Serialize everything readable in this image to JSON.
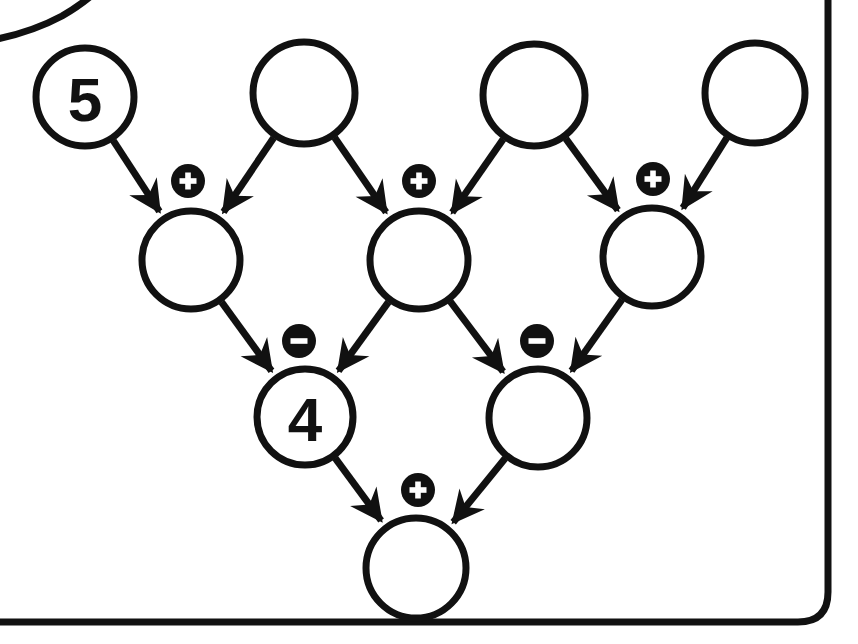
{
  "canvas": {
    "width": 858,
    "height": 644,
    "background": "#ffffff",
    "ink": "#111111",
    "badge_fill": "#111111",
    "badge_glyph_color": "#ffffff"
  },
  "frame": {
    "name": "rounded-card-border",
    "stroke": "#111111",
    "stroke_width": 7,
    "corner_radius": 30,
    "note": "outer rounded rectangle, cropped at left and top edges; second inner arc visible at top-left"
  },
  "diagram": {
    "type": "arithmetic-pyramid",
    "title": "",
    "rows": [
      {
        "row_index": 0,
        "name": "top-operand-row",
        "nodes": [
          {
            "id": "t1",
            "label": "5",
            "filled": false,
            "cx": 85,
            "cy": 97,
            "r": 49
          },
          {
            "id": "t2",
            "label": "",
            "filled": false,
            "cx": 304,
            "cy": 93,
            "r": 51
          },
          {
            "id": "t3",
            "label": "",
            "filled": false,
            "cx": 534,
            "cy": 95,
            "r": 51
          },
          {
            "id": "t4",
            "label": "",
            "filled": false,
            "cx": 755,
            "cy": 93,
            "r": 50
          }
        ]
      },
      {
        "row_index": 1,
        "name": "second-row",
        "nodes": [
          {
            "id": "m1",
            "label": "",
            "filled": false,
            "cx": 191,
            "cy": 260,
            "r": 49
          },
          {
            "id": "m2",
            "label": "",
            "filled": false,
            "cx": 419,
            "cy": 260,
            "r": 49
          },
          {
            "id": "m3",
            "label": "",
            "filled": false,
            "cx": 652,
            "cy": 257,
            "r": 49
          }
        ]
      },
      {
        "row_index": 2,
        "name": "third-row",
        "nodes": [
          {
            "id": "b1",
            "label": "4",
            "filled": false,
            "cx": 305,
            "cy": 417,
            "r": 48
          },
          {
            "id": "b2",
            "label": "",
            "filled": false,
            "cx": 538,
            "cy": 418,
            "r": 49
          }
        ]
      },
      {
        "row_index": 3,
        "name": "result-row",
        "nodes": [
          {
            "id": "r1",
            "label": "",
            "filled": false,
            "cx": 416,
            "cy": 568,
            "r": 50
          }
        ]
      }
    ],
    "operators": [
      {
        "id": "op1",
        "symbol": "+",
        "name": "plus",
        "cx": 188,
        "cy": 181,
        "r": 17,
        "inputs": [
          "t1",
          "t2"
        ],
        "output": "m1"
      },
      {
        "id": "op2",
        "symbol": "+",
        "name": "plus",
        "cx": 419,
        "cy": 181,
        "r": 17,
        "inputs": [
          "t2",
          "t3"
        ],
        "output": "m2"
      },
      {
        "id": "op3",
        "symbol": "+",
        "name": "plus",
        "cx": 653,
        "cy": 179,
        "r": 17,
        "inputs": [
          "t3",
          "t4"
        ],
        "output": "m3"
      },
      {
        "id": "op4",
        "symbol": "−",
        "name": "minus",
        "cx": 299,
        "cy": 341,
        "r": 17,
        "inputs": [
          "m1",
          "m2"
        ],
        "output": "b1"
      },
      {
        "id": "op5",
        "symbol": "−",
        "name": "minus",
        "cx": 537,
        "cy": 341,
        "r": 17,
        "inputs": [
          "m2",
          "m3"
        ],
        "output": "b2"
      },
      {
        "id": "op6",
        "symbol": "+",
        "name": "plus",
        "cx": 418,
        "cy": 490,
        "r": 17,
        "inputs": [
          "b1",
          "b2"
        ],
        "output": "r1"
      }
    ],
    "edges": [
      {
        "from": "t1",
        "to": "m1"
      },
      {
        "from": "t2",
        "to": "m1"
      },
      {
        "from": "t2",
        "to": "m2"
      },
      {
        "from": "t3",
        "to": "m2"
      },
      {
        "from": "t3",
        "to": "m3"
      },
      {
        "from": "t4",
        "to": "m3"
      },
      {
        "from": "m1",
        "to": "b1"
      },
      {
        "from": "m2",
        "to": "b1"
      },
      {
        "from": "m2",
        "to": "b2"
      },
      {
        "from": "m3",
        "to": "b2"
      },
      {
        "from": "b1",
        "to": "r1"
      },
      {
        "from": "b2",
        "to": "r1"
      }
    ],
    "given_values": [
      {
        "node": "t1",
        "value": "5"
      },
      {
        "node": "b1",
        "value": "4"
      }
    ]
  }
}
